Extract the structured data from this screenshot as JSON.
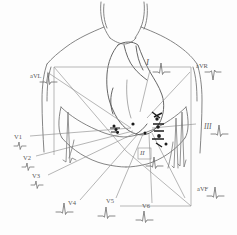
{
  "diagram": {
    "style": "hand-drawn pencil sketch",
    "ink_color": "#6b6b6b",
    "accent_color": "#2b2b2b",
    "background_color": "#fdfdfd"
  },
  "limb_leads": [
    {
      "id": "I",
      "label": "I",
      "x": 148,
      "y": 62,
      "waveform": "qrs-upright"
    },
    {
      "id": "II",
      "label": "II",
      "x": 145,
      "y": 155,
      "waveform": "qrs-upright"
    },
    {
      "id": "III",
      "label": "III",
      "x": 207,
      "y": 128,
      "waveform": "qrs-upright"
    }
  ],
  "augmented_leads": [
    {
      "id": "aVR",
      "label": "aVR",
      "x": 199,
      "y": 68,
      "waveform": "qrs-inverted"
    },
    {
      "id": "aVL",
      "label": "aVL",
      "x": 34,
      "y": 78,
      "waveform": "qrs-upright"
    },
    {
      "id": "aVF",
      "label": "aVF",
      "x": 200,
      "y": 190,
      "waveform": "qrs-upright"
    }
  ],
  "precordial_leads": [
    {
      "id": "V1",
      "label": "V1",
      "x": 18,
      "y": 139,
      "waveform": "rs-small"
    },
    {
      "id": "V2",
      "label": "V2",
      "x": 27,
      "y": 160,
      "waveform": "rs-small"
    },
    {
      "id": "V3",
      "label": "V3",
      "x": 36,
      "y": 178,
      "waveform": "rs-small"
    },
    {
      "id": "V4",
      "label": "V4",
      "x": 72,
      "y": 205,
      "waveform": "qrs-upright"
    },
    {
      "id": "V5",
      "label": "V5",
      "x": 110,
      "y": 203,
      "waveform": "qrs-upright"
    },
    {
      "id": "V6",
      "label": "V6",
      "x": 146,
      "y": 208,
      "waveform": "qrs-upright"
    }
  ],
  "electrodes": {
    "count": 9,
    "points": [
      {
        "x": 114,
        "y": 126
      },
      {
        "x": 116,
        "y": 129
      },
      {
        "x": 117,
        "y": 132
      },
      {
        "x": 133,
        "y": 124
      },
      {
        "x": 145,
        "y": 133
      },
      {
        "x": 157,
        "y": 119
      },
      {
        "x": 158,
        "y": 127
      },
      {
        "x": 159,
        "y": 136
      },
      {
        "x": 166,
        "y": 144
      }
    ]
  }
}
